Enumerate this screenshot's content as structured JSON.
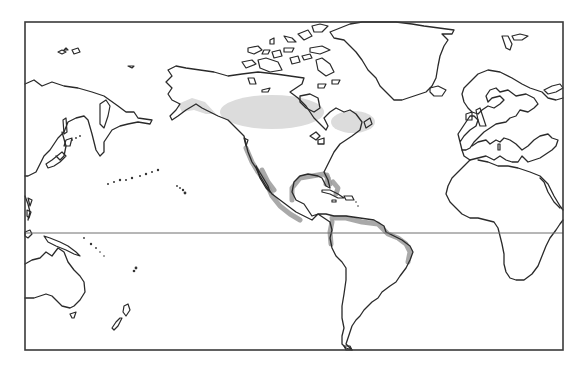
{
  "map": {
    "type": "world-outline-map",
    "projection_center": "Pacific / Americas",
    "frame": {
      "x": 25,
      "y": 22,
      "width": 538,
      "height": 328
    },
    "equator_y": 233,
    "colors": {
      "background": "#ffffff",
      "coastline": "#2a2a2a",
      "frame": "#3a3a3a",
      "equator": "#6e6e6e",
      "range_light": "#dcdcdc",
      "range_dark": "#9a9a9a"
    },
    "landmasses": [
      "Asia (east)",
      "Japan",
      "Australia",
      "New Zealand",
      "North America",
      "Greenland",
      "Central America",
      "Caribbean islands",
      "South America",
      "Europe",
      "Africa",
      "Svalbard",
      "Iceland",
      "British Isles"
    ],
    "shaded_regions": [
      {
        "name": "central-canada-range",
        "shade": "light"
      },
      {
        "name": "eastern-canada-range",
        "shade": "light"
      },
      {
        "name": "pacific-coast-range",
        "shade": "dark"
      },
      {
        "name": "gulf-coast-range",
        "shade": "dark"
      },
      {
        "name": "caribbean-range",
        "shade": "dark"
      },
      {
        "name": "northern-south-america-range",
        "shade": "dark"
      }
    ]
  }
}
